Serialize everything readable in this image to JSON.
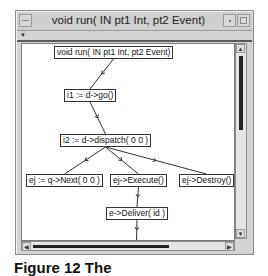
{
  "window": {
    "title": "void run( IN pt1 Int, pt2 Event)"
  },
  "graph": {
    "nodes": [
      {
        "id": "n0",
        "label": "void run( IN pt1 Int, pt2 Event)"
      },
      {
        "id": "n1",
        "label": "i1 := d->go()"
      },
      {
        "id": "n2",
        "label": "i2 := d->dispatch( 0 0 )"
      },
      {
        "id": "n3",
        "label": "ej := q->Next( 0 0 )"
      },
      {
        "id": "n4",
        "label": "ej->Execute()"
      },
      {
        "id": "n5",
        "label": "ej->Destroy()"
      },
      {
        "id": "n6",
        "label": "e->Deliver( id )"
      },
      {
        "id": "n7",
        "label": "a->Handle( e )"
      }
    ],
    "edges": [
      {
        "from": "n0",
        "to": "n1"
      },
      {
        "from": "n1",
        "to": "n2"
      },
      {
        "from": "n2",
        "to": "n3"
      },
      {
        "from": "n2",
        "to": "n4"
      },
      {
        "from": "n2",
        "to": "n5"
      },
      {
        "from": "n4",
        "to": "n6"
      },
      {
        "from": "n6",
        "to": "n7"
      }
    ]
  },
  "caption": "Figure 12 The"
}
